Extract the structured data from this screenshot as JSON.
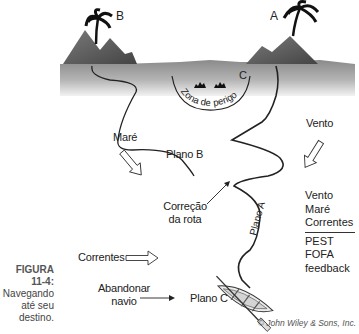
{
  "figure": {
    "number": "FIGURA 11-4:",
    "caption_lines": [
      "Navegando",
      "até seu",
      "destino."
    ],
    "credit": "© John Wiley & Sons, Inc."
  },
  "islands": {
    "b_label": "B",
    "a_label": "A",
    "c_label": "C",
    "danger_zone": "Zona de perigo"
  },
  "forces": {
    "tide": "Maré",
    "wind": "Vento",
    "currents": "Correntes"
  },
  "plans": {
    "plan_a": "Plano A",
    "plan_b": "Plano B",
    "plan_c": "Plano C",
    "course_correction_line1": "Correção",
    "course_correction_line2": "da rota",
    "abandon_line1": "Abandonar",
    "abandon_line2": "navio"
  },
  "legend": {
    "top": [
      "Vento",
      "Maré",
      "Correntes"
    ],
    "bottom": [
      "PEST",
      "FOFA",
      "feedback"
    ]
  },
  "colors": {
    "sea_dark": "#7a7a7a",
    "sea_light": "#e6e6e6",
    "mountain": "#5a5a5a",
    "line": "#222222"
  }
}
